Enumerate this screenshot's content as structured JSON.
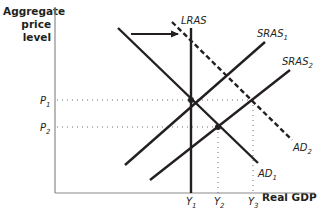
{
  "diagram": {
    "type": "AD-AS model",
    "y_axis_label_line1": "Aggregate",
    "y_axis_label_line2": "price level",
    "x_axis_label": "Real GDP",
    "curves": {
      "lras": {
        "name": "LRAS",
        "style": "solid"
      },
      "sras1": {
        "name": "SRAS",
        "sub": "1",
        "style": "solid"
      },
      "sras2": {
        "name": "SRAS",
        "sub": "2",
        "style": "solid"
      },
      "ad1": {
        "name": "AD",
        "sub": "1",
        "style": "solid"
      },
      "ad2": {
        "name": "AD",
        "sub": "2",
        "style": "dashed"
      }
    },
    "price_levels": [
      {
        "name": "P",
        "sub": "1"
      },
      {
        "name": "P",
        "sub": "2"
      }
    ],
    "output_levels": [
      {
        "name": "Y",
        "sub": "1"
      },
      {
        "name": "Y",
        "sub": "2"
      },
      {
        "name": "Y",
        "sub": "3"
      }
    ],
    "shift_arrow": "rightward shift of AD from AD1 to AD2",
    "equilibria": [
      {
        "at": "P1, Y1",
        "curves": "AD1, SRAS1, LRAS"
      },
      {
        "at": "P2, Y2",
        "curves": "AD1, SRAS2"
      },
      {
        "at": "P1, Y3",
        "curves": "AD2, SRAS2"
      }
    ],
    "colors": {
      "ink": "#231f20",
      "dotted": "#6d6e71"
    }
  }
}
